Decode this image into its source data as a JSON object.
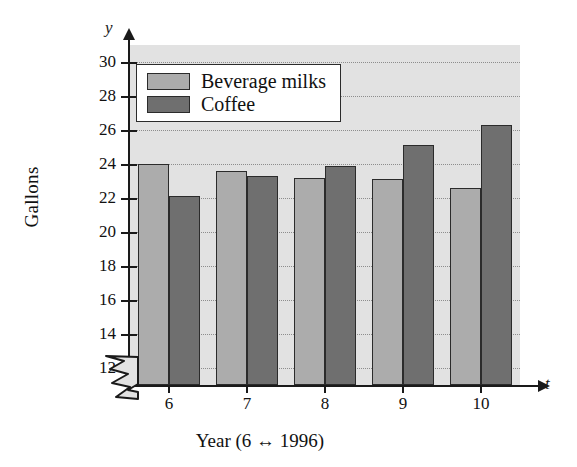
{
  "chart_data": {
    "type": "bar",
    "title": "",
    "subtitle": "",
    "xlabel": "Year (6 ↔ 1996)",
    "ylabel": "Gallons",
    "x_axis_letter": "t",
    "y_axis_letter": "y",
    "categories": [
      "6",
      "7",
      "8",
      "9",
      "10"
    ],
    "series": [
      {
        "name": "Beverage milks",
        "color": "#acacac",
        "values": [
          24.0,
          23.6,
          23.2,
          23.1,
          22.6
        ]
      },
      {
        "name": "Coffee",
        "color": "#6f6f6f",
        "values": [
          22.1,
          23.3,
          23.9,
          25.1,
          26.3
        ]
      }
    ],
    "ylim": [
      11,
      31
    ],
    "yticks": [
      12,
      14,
      16,
      18,
      20,
      22,
      24,
      26,
      28,
      30
    ],
    "ytick_labels": [
      "12",
      "14",
      "16",
      "18",
      "20",
      "22",
      "24",
      "26",
      "28",
      "30"
    ],
    "grid": true,
    "grid_style": "dotted",
    "axis_break": true,
    "legend_position": "top-left",
    "plot_background": "#e2e2e2",
    "axis_color": "#1a1a1a"
  },
  "legend": {
    "entries": [
      {
        "label": "Beverage milks",
        "swatch": "#acacac"
      },
      {
        "label": "Coffee",
        "swatch": "#6f6f6f"
      }
    ]
  }
}
